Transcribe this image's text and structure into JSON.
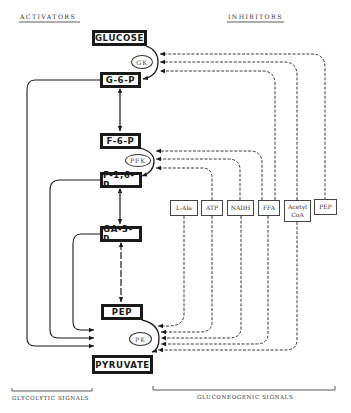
{
  "headers": {
    "activators": "ACTIVATORS",
    "inhibitors": "INHIBITORS"
  },
  "metabolites": [
    {
      "id": "glucose",
      "label": "GLUCOSE"
    },
    {
      "id": "g6p",
      "label": "G-6-P"
    },
    {
      "id": "f6p",
      "label": "F-6-P"
    },
    {
      "id": "f16p",
      "label": "F-1,6-P"
    },
    {
      "id": "ga3p",
      "label": "GA-3-P"
    },
    {
      "id": "pep",
      "label": "PEP"
    },
    {
      "id": "pyruvate",
      "label": "PYRUVATE"
    }
  ],
  "enzymes": [
    {
      "id": "gk",
      "label": "GK"
    },
    {
      "id": "pfk",
      "label": "PFK"
    },
    {
      "id": "pk",
      "label": "PK"
    }
  ],
  "inhibitors": [
    {
      "id": "lala",
      "label": "L-Ala"
    },
    {
      "id": "atp",
      "label": "ATP"
    },
    {
      "id": "nadh",
      "label": "NADH"
    },
    {
      "id": "ffa",
      "label": "FFA"
    },
    {
      "id": "acetylcoa",
      "label": "Acetyl CoA"
    },
    {
      "id": "pep_inh",
      "label": "PEP"
    }
  ],
  "footer": {
    "glycolytic": "GLYCOLYTIC SIGNALS",
    "gluconeogenic": "GLUCONEOGENIC SIGNALS"
  },
  "colors": {
    "line": "#1a1a1a",
    "background": "#ffffff"
  }
}
